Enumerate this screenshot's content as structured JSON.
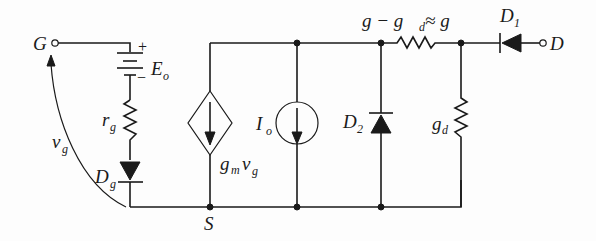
{
  "diagram": {
    "type": "equivalent circuit (small-signal model)",
    "terminals": {
      "gate": "G",
      "drain": "D",
      "source": "S"
    },
    "components": {
      "battery": {
        "label": "E",
        "sub": "o",
        "plus": "+",
        "minus": "−"
      },
      "gate_resistor": {
        "label": "r",
        "sub": "g"
      },
      "gate_diode": {
        "label": "D",
        "sub": "g"
      },
      "gate_voltage": {
        "label": "v",
        "sub": "g"
      },
      "dependent_source": {
        "label_g": "g",
        "label_m": "m",
        "label_v": "v",
        "label_vsub": "g"
      },
      "current_source": {
        "label": "I",
        "sub": "o"
      },
      "diode2": {
        "label": "D",
        "sub": "2"
      },
      "series_conductance": {
        "part1": "g − g",
        "sub": "d",
        "part2": " ≈ g"
      },
      "shunt_conductance": {
        "label": "g",
        "sub": "d"
      },
      "diode1": {
        "label": "D",
        "sub": "1"
      }
    }
  }
}
